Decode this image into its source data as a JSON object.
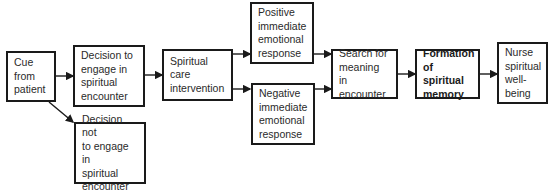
{
  "diagram": {
    "nodes": [
      {
        "id": "cue",
        "label": "Cue\nfrom\npatient"
      },
      {
        "id": "engage",
        "label": "Decision to\nengage in\nspiritual\nencounter"
      },
      {
        "id": "not_engage",
        "label": "Decision not\nto engage in\nspiritual\nencounter"
      },
      {
        "id": "intervention",
        "label": "Spiritual care\nintervention"
      },
      {
        "id": "positive",
        "label": "Positive\nimmediate\nemotional\nresponse"
      },
      {
        "id": "negative",
        "label": "Negative\nimmediate\nemotional\nresponse"
      },
      {
        "id": "search",
        "label": "Search for\nmeaning in\nencounter"
      },
      {
        "id": "formation",
        "label": "Formation\nof spiritual\nmemory",
        "bold": true
      },
      {
        "id": "nurse",
        "label": "Nurse\nspiritual\nwell-\nbeing"
      }
    ],
    "edges": [
      {
        "from": "cue",
        "to": "engage"
      },
      {
        "from": "cue",
        "to": "not_engage"
      },
      {
        "from": "engage",
        "to": "intervention"
      },
      {
        "from": "intervention",
        "to": "positive"
      },
      {
        "from": "intervention",
        "to": "negative"
      },
      {
        "from": "positive",
        "to": "search"
      },
      {
        "from": "negative",
        "to": "search"
      },
      {
        "from": "search",
        "to": "formation"
      },
      {
        "from": "formation",
        "to": "nurse"
      }
    ]
  }
}
